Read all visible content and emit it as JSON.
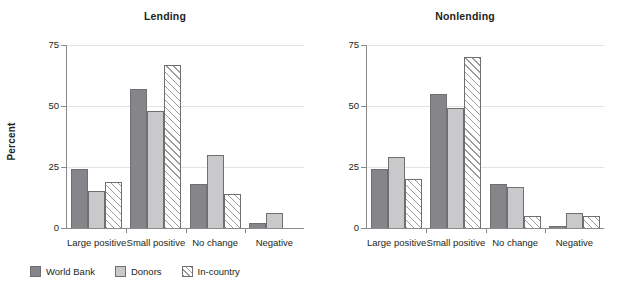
{
  "figure": {
    "ylabel": "Percent"
  },
  "legend": {
    "position": "bottom-left",
    "items": [
      {
        "label": "World Bank",
        "swatch": "dark-gray-solid-swatch"
      },
      {
        "label": "Donors",
        "swatch": "light-gray-solid-swatch"
      },
      {
        "label": "In-country",
        "swatch": "white-hatched-swatch"
      }
    ]
  },
  "chart_data": [
    {
      "type": "bar",
      "title": "Lending",
      "xlabel": "",
      "ylabel": "Percent",
      "ylim": [
        0,
        75
      ],
      "yticks": [
        0,
        25,
        50,
        75
      ],
      "ytick_labels": [
        "0",
        "25",
        "50",
        "75"
      ],
      "grid": true,
      "categories": [
        "Large positive",
        "Small positive",
        "No change",
        "Negative"
      ],
      "series": [
        {
          "name": "World Bank",
          "values": [
            24,
            57,
            18,
            2
          ]
        },
        {
          "name": "Donors",
          "values": [
            15,
            48,
            30,
            6
          ]
        },
        {
          "name": "In-country",
          "values": [
            19,
            67,
            14,
            0
          ]
        }
      ]
    },
    {
      "type": "bar",
      "title": "Nonlending",
      "xlabel": "",
      "ylabel": "Percent",
      "ylim": [
        0,
        75
      ],
      "yticks": [
        0,
        25,
        50,
        75
      ],
      "ytick_labels": [
        "0",
        "25",
        "50",
        "75"
      ],
      "grid": true,
      "categories": [
        "Large positive",
        "Small positive",
        "No change",
        "Negative"
      ],
      "series": [
        {
          "name": "World Bank",
          "values": [
            24,
            55,
            18,
            1
          ]
        },
        {
          "name": "Donors",
          "values": [
            29,
            49,
            17,
            6
          ]
        },
        {
          "name": "In-country",
          "values": [
            20,
            70,
            5,
            5
          ]
        }
      ]
    }
  ]
}
